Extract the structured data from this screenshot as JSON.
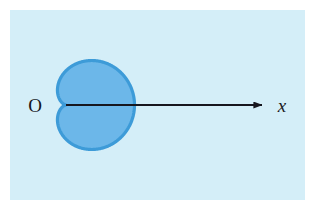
{
  "figure": {
    "kind": "polar-curve-diagram",
    "curve_name": "cardioid",
    "panel": {
      "background_color": "#d4eef8",
      "x": 10,
      "y": 10,
      "width": 295,
      "height": 190
    },
    "page_background_color": "#ffffff"
  },
  "labels": {
    "origin": "O",
    "x_axis": "x"
  },
  "axis": {
    "name": "x-axis",
    "color": "#16161e",
    "start_x": 66,
    "start_y": 105,
    "end_x": 266,
    "end_y": 105,
    "arrow": "right-arrowhead",
    "stroke_width": 2.2
  },
  "curve": {
    "name": "cardioid-curve",
    "equation": "r = a(1 + cos θ)",
    "fill_color": "#6cb7e9",
    "stroke_color": "#3d9bd8",
    "stroke_width": 3.2,
    "cusp": {
      "x": 66,
      "y": 105
    },
    "rightmost": {
      "x": 203,
      "y": 105
    },
    "topmost": {
      "x": 131,
      "y": 29
    },
    "bottommost": {
      "x": 131,
      "y": 181
    },
    "leftmost_lobe": {
      "x": 49,
      "y": 68
    },
    "scale_a": 34.25,
    "center_x": 66,
    "center_y": 105,
    "opens": "right"
  },
  "chart_data": {
    "type": "line",
    "title": "",
    "xlabel": "x",
    "ylabel": "",
    "polar_equation": "r = a(1 + cos θ)",
    "series": [
      {
        "name": "cardioid",
        "theta_degrees": [
          0,
          30,
          60,
          90,
          120,
          150,
          180,
          210,
          240,
          270,
          300,
          330,
          360
        ],
        "r_over_a": [
          2.0,
          1.866,
          1.5,
          1.0,
          0.5,
          0.134,
          0.0,
          0.134,
          0.5,
          1.0,
          1.5,
          1.866,
          2.0
        ]
      }
    ],
    "annotations": [
      "O",
      "x"
    ]
  }
}
